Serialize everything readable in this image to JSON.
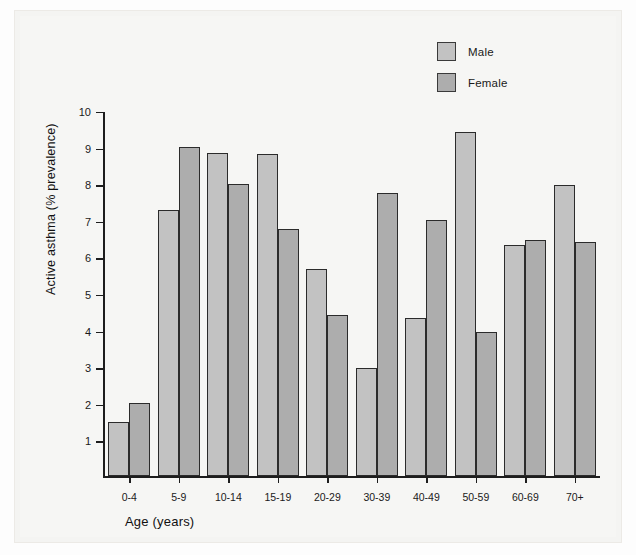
{
  "chart_data": {
    "type": "bar",
    "title": "",
    "xlabel": "Age (years)",
    "ylabel": "Active asthma (% prevalence)",
    "categories": [
      "0-4",
      "5-9",
      "10-14",
      "15-19",
      "20-29",
      "30-39",
      "40-49",
      "50-59",
      "60-69",
      "70+"
    ],
    "series": [
      {
        "name": "Male",
        "color": "#c2c2c2",
        "values": [
          1.5,
          7.28,
          8.85,
          8.82,
          5.67,
          2.95,
          4.33,
          9.42,
          6.32,
          7.95
        ]
      },
      {
        "name": "Female",
        "color": "#adadad",
        "values": [
          2.0,
          9.0,
          7.98,
          6.75,
          4.4,
          7.75,
          7.0,
          3.95,
          6.45,
          6.4
        ]
      }
    ],
    "ylim": [
      0,
      10
    ],
    "yticks": [
      1,
      2,
      3,
      4,
      5,
      6,
      7,
      8,
      9,
      10
    ],
    "ytick_labels": [
      "1",
      "2",
      "3",
      "4",
      "5",
      "6",
      "7",
      "8",
      "9",
      "10"
    ],
    "grid": false,
    "legend_position": "top-right"
  },
  "legend": {
    "items": [
      {
        "label": "Male",
        "swatch": "#c2c2c2"
      },
      {
        "label": "Female",
        "swatch": "#adadad"
      }
    ]
  },
  "axes": {
    "y_title": "Active asthma (% prevalence)",
    "x_title": "Age (years)"
  }
}
